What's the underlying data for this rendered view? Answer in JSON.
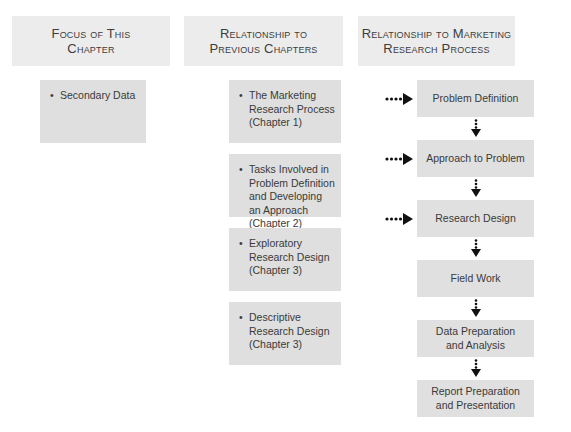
{
  "headers": [
    {
      "line1": "Focus of This",
      "line2": "Chapter"
    },
    {
      "line1": "Relationship to",
      "line2": "Previous Chapters"
    },
    {
      "line1": "Relationship to Marketing",
      "line2": "Research Process"
    }
  ],
  "focus": {
    "items": [
      "Secondary Data"
    ]
  },
  "previous_chapters": {
    "items": [
      "The Marketing Research Process (Chapter 1)",
      "Tasks Involved in Problem Definition and Developing an Approach (Chapter 2)",
      "Exploratory Research Design (Chapter 3)",
      "Descriptive Research Design (Chapter 3)"
    ]
  },
  "process": {
    "steps": [
      {
        "line1": "Problem Definition",
        "line2": "",
        "linked": true
      },
      {
        "line1": "Approach to Problem",
        "line2": "",
        "linked": true
      },
      {
        "line1": "Research Design",
        "line2": "",
        "linked": true
      },
      {
        "line1": "Field Work",
        "line2": "",
        "linked": false
      },
      {
        "line1": "Data Preparation",
        "line2": "and Analysis",
        "linked": false
      },
      {
        "line1": "Report Preparation",
        "line2": "and Presentation",
        "linked": false
      }
    ]
  }
}
